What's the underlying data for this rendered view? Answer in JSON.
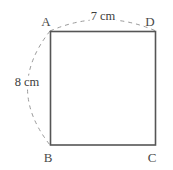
{
  "figure": {
    "shape": {
      "name": "square",
      "vertices": [
        {
          "id": "A",
          "label": "A",
          "position": "top-left"
        },
        {
          "id": "D",
          "label": "D",
          "position": "top-right"
        },
        {
          "id": "B",
          "label": "B",
          "position": "bottom-left"
        },
        {
          "id": "C",
          "label": "C",
          "position": "bottom-right"
        }
      ],
      "stroke_color": "#555555"
    },
    "dimensions": [
      {
        "id": "top",
        "label": "7 cm",
        "value": 7,
        "unit": "cm",
        "from": "A",
        "to": "D",
        "style": "dashed-arc",
        "arc_color": "#9a9a9a"
      },
      {
        "id": "left",
        "label": "8 cm",
        "value": 8,
        "unit": "cm",
        "from": "A",
        "to": "B",
        "style": "dashed-arc",
        "arc_color": "#9a9a9a"
      }
    ]
  }
}
